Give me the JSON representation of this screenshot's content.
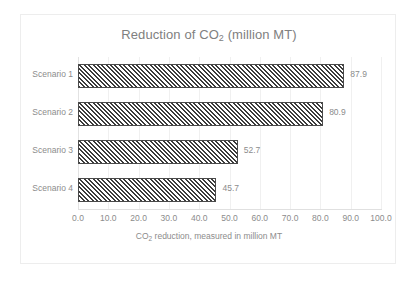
{
  "chart_data": {
    "type": "bar",
    "orientation": "horizontal",
    "title": "Reduction of CO2 (million MT)",
    "title_parts": {
      "before": "Reduction of CO",
      "sub": "2",
      "after": " (million MT)"
    },
    "categories": [
      "Scenario 1",
      "Scenario 2",
      "Scenario 3",
      "Scenario 4"
    ],
    "values": [
      87.9,
      80.9,
      52.7,
      45.7
    ],
    "value_labels": [
      "87.9",
      "80.9",
      "52.7",
      "45.7"
    ],
    "xlabel": "CO2 reduction, measured in million MT",
    "xlabel_parts": {
      "before": "CO",
      "sub": "2",
      "after": " reduction, measured in million MT"
    },
    "ylabel": "",
    "xlim": [
      0,
      100
    ],
    "xticks": [
      0,
      10,
      20,
      30,
      40,
      50,
      60,
      70,
      80,
      90,
      100
    ],
    "xtick_labels": [
      "0.0",
      "10.0",
      "20.0",
      "30.0",
      "40.0",
      "50.0",
      "60.0",
      "70.0",
      "80.0",
      "90.0",
      "100.0"
    ],
    "grid": true,
    "grid_axis": "x",
    "legend": false,
    "bar_fill": "diagonal-hatch",
    "colors": {
      "bar_line": "#4a4a4a",
      "bar_hatch": "#3c3c3c",
      "bar_background": "#ffffff",
      "text": "#8c8c8c",
      "title_text": "#808080",
      "gridline": "#f0f0f0",
      "axis_line": "#e0e0e0",
      "frame_border": "#ededed",
      "page_background": "#ffffff"
    }
  }
}
